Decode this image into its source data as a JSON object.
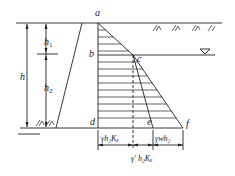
{
  "diagram": {
    "type": "retaining-wall-earth-pressure",
    "points": {
      "a": "a",
      "b": "b",
      "c": "c",
      "d": "d",
      "e": "e",
      "f": "f"
    },
    "heights": {
      "h": "h",
      "h1": "h",
      "h1_sub": "1",
      "h2": "h",
      "h2_sub": "2"
    },
    "bottom_labels": {
      "left_segment": "γh₁Kₐ",
      "right_segment": "γwh₂",
      "middle_segment": "γ′ h₂Kₐ"
    },
    "symbols": {
      "water_table": "water-level-triangle",
      "ground": "soil-hatch"
    },
    "colors": {
      "line": "#222222",
      "background": "#ffffff"
    }
  }
}
